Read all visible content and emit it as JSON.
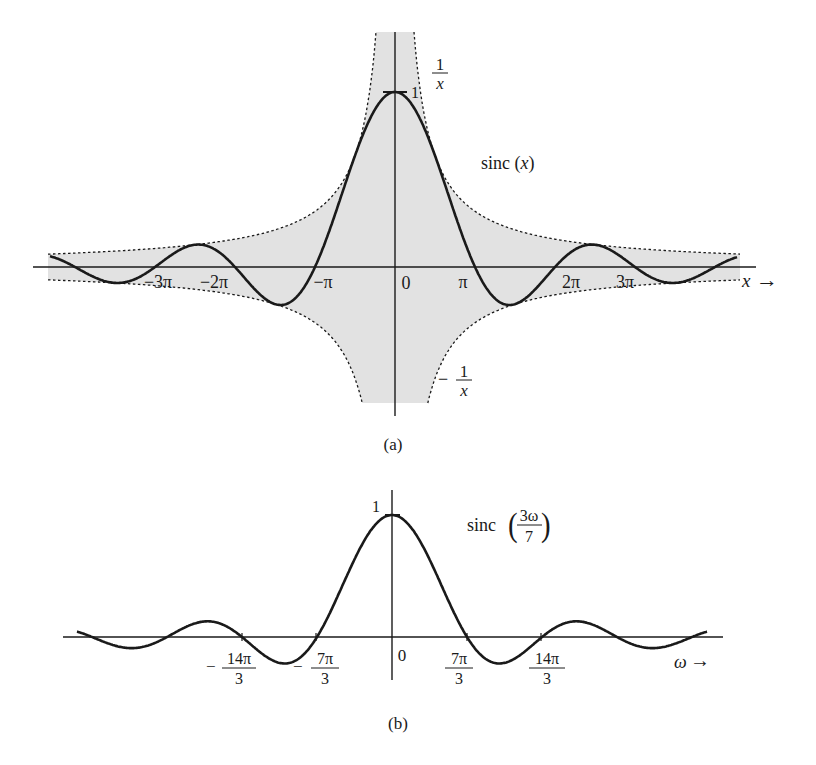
{
  "chart_data": [
    {
      "id": "a",
      "type": "line",
      "title": "sinc (x)",
      "caption": "(a)",
      "xlabel": "x",
      "ylabel": "",
      "function": "sinc(x) = sin(x)/x",
      "envelope": {
        "upper": "1/x",
        "lower": "-1/x",
        "style": "dashed",
        "shaded": true
      },
      "x_ticks": [
        {
          "label": "−3π",
          "value": -9.4248
        },
        {
          "label": "−2π",
          "value": -6.2832
        },
        {
          "label": "−π",
          "value": -3.1416
        },
        {
          "label": "0",
          "value": 0
        },
        {
          "label": "π",
          "value": 3.1416
        },
        {
          "label": "2π",
          "value": 6.2832
        },
        {
          "label": "3π",
          "value": 9.4248
        }
      ],
      "y_ticks": [
        {
          "label": "1",
          "value": 1
        }
      ],
      "annotations": [
        "1/x",
        "−1/x",
        "sinc (x)"
      ],
      "xlim": [
        -11.5,
        11.5
      ],
      "ylim": [
        -0.45,
        1.0
      ],
      "x": [
        -11,
        -9.42,
        -7.73,
        -6.28,
        -4.49,
        -3.14,
        -1.5,
        0,
        1.5,
        3.14,
        4.49,
        6.28,
        7.73,
        9.42,
        11
      ],
      "values": [
        -0.091,
        0.0,
        0.128,
        0.0,
        -0.217,
        0.0,
        0.665,
        1.0,
        0.665,
        0.0,
        -0.217,
        0.0,
        0.128,
        0.0,
        -0.091
      ],
      "grid": false
    },
    {
      "id": "b",
      "type": "line",
      "title": "sinc (3ω/7)",
      "caption": "(b)",
      "xlabel": "ω",
      "ylabel": "",
      "function": "sinc(3ω/7)",
      "x_ticks": [
        {
          "label": "−14π/3",
          "value": -14.661
        },
        {
          "label": "−7π/3",
          "value": -7.33
        },
        {
          "label": "0",
          "value": 0
        },
        {
          "label": "7π/3",
          "value": 7.33
        },
        {
          "label": "14π/3",
          "value": 14.661
        }
      ],
      "y_ticks": [
        {
          "label": "1",
          "value": 1
        }
      ],
      "xlim": [
        -25,
        25
      ],
      "ylim": [
        -0.25,
        1.0
      ],
      "x": [
        -24.5,
        -21.99,
        -18.0,
        -14.66,
        -10.48,
        -7.33,
        -3.5,
        0,
        3.5,
        7.33,
        10.48,
        14.66,
        18.0,
        21.99,
        24.5
      ],
      "values": [
        0.09,
        0.0,
        0.128,
        0.0,
        -0.217,
        0.0,
        0.665,
        1.0,
        0.665,
        0.0,
        -0.217,
        0.0,
        0.128,
        0.0,
        0.09
      ],
      "grid": false
    }
  ],
  "plot_a": {
    "caption": "(a)",
    "curve_label": "sinc (x)",
    "upper_env_num": "1",
    "upper_env_den": "x",
    "lower_env_sign": "−",
    "lower_env_num": "1",
    "lower_env_den": "x",
    "peak_label": "1",
    "origin_label": "0",
    "axis_label": "x",
    "arrow": "→",
    "ticks": {
      "m3pi": "−3π",
      "m2pi": "−2π",
      "mpi": "−π",
      "pi": "π",
      "p2pi": "2π",
      "p3pi": "3π"
    }
  },
  "plot_b": {
    "caption": "(b)",
    "curve_label_pre": "sinc",
    "curve_label_num": "3ω",
    "curve_label_den": "7",
    "peak_label": "1",
    "origin_label": "0",
    "axis_label": "ω",
    "arrow": "→",
    "ticks": {
      "m14_sign": "−",
      "m14_num": "14π",
      "m14_den": "3",
      "m7_sign": "−",
      "m7_num": "7π",
      "m7_den": "3",
      "p7_num": "7π",
      "p7_den": "3",
      "p14_num": "14π",
      "p14_den": "3"
    }
  },
  "colors": {
    "curve": "#1a1a1a",
    "shade": "#e2e2e2",
    "axis": "#1a1a1a",
    "background": "#ffffff"
  }
}
